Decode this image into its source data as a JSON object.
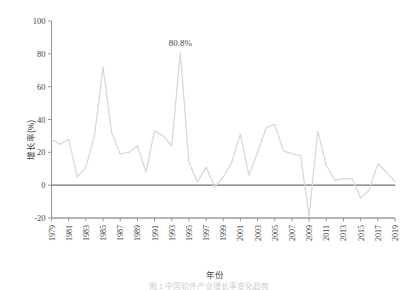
{
  "chart_data": {
    "type": "line",
    "title": "",
    "xlabel": "年份",
    "ylabel": "增长率(%)",
    "xlim": [
      1979,
      2019
    ],
    "ylim": [
      -20,
      100
    ],
    "yticks": [
      -20,
      0,
      20,
      40,
      60,
      80,
      100
    ],
    "ytick_labels": [
      "-20",
      "0",
      "20",
      "40",
      "60",
      "80",
      "100"
    ],
    "xticks": [
      1979,
      1981,
      1983,
      1985,
      1987,
      1989,
      1991,
      1993,
      1995,
      1997,
      1999,
      2001,
      2003,
      2005,
      2007,
      2009,
      2011,
      2013,
      2015,
      2017,
      2019
    ],
    "xtick_labels": [
      "1979",
      "1981",
      "1983",
      "1985",
      "1987",
      "1989",
      "1991",
      "1993",
      "1995",
      "1997",
      "1999",
      "2001",
      "2003",
      "2005",
      "2007",
      "2009",
      "2011",
      "2013",
      "2015",
      "2017",
      "2019"
    ],
    "grid": false,
    "legend": false,
    "zero_line": true,
    "line_color": "#d9d9d9",
    "zero_line_color": "#707070",
    "axis_color": "#9a9a9a",
    "annotations": [
      {
        "label": "80.8%",
        "x": 1994,
        "y": 80.8
      }
    ],
    "x": [
      1979,
      1980,
      1981,
      1982,
      1983,
      1984,
      1985,
      1986,
      1987,
      1988,
      1989,
      1990,
      1991,
      1992,
      1993,
      1994,
      1995,
      1996,
      1997,
      1998,
      1999,
      2000,
      2001,
      2002,
      2003,
      2004,
      2005,
      2006,
      2007,
      2008,
      2009,
      2010,
      2011,
      2012,
      2013,
      2014,
      2015,
      2016,
      2017,
      2018,
      2019
    ],
    "series": [
      {
        "name": "增长率",
        "values": [
          28,
          25,
          28,
          5,
          11,
          30,
          72,
          32,
          19,
          20,
          24,
          8,
          33,
          30,
          24,
          80.8,
          14,
          2,
          11,
          -1,
          5,
          14,
          31,
          6,
          20,
          35,
          37,
          21,
          19,
          18,
          -19,
          33,
          12,
          3,
          4,
          4,
          -8,
          -3,
          13,
          8,
          2
        ]
      }
    ]
  },
  "caption": {
    "text": "图 1    中国软件产业增长率变化趋势"
  }
}
